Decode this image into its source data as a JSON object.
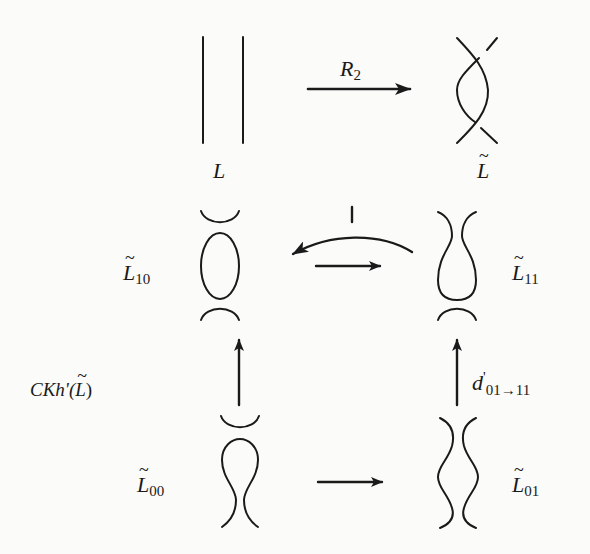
{
  "figure": {
    "move": {
      "label": "R",
      "label_subscript": "2",
      "source_label": "L",
      "target_label": "L",
      "target_tilde": "~"
    },
    "resolutions": [
      {
        "id": "10",
        "label": "L",
        "tilde": "~",
        "subscript": "10",
        "shape": "cap-circle-cup"
      },
      {
        "id": "11",
        "label": "L",
        "tilde": "~",
        "subscript": "11",
        "shape": "cap-bulb-cup"
      },
      {
        "id": "00",
        "label": "L",
        "tilde": "~",
        "subscript": "00",
        "shape": "cap-bulb-inverted"
      },
      {
        "id": "01",
        "label": "L",
        "tilde": "~",
        "subscript": "01",
        "shape": "two-wavy-strands"
      }
    ],
    "complex_label": {
      "prefix": "CKh'(",
      "letter": "L",
      "tilde": "~",
      "suffix": ")"
    },
    "differential_label": {
      "letter": "d",
      "prime": "'",
      "from": "01",
      "arrow": "→",
      "to": "11"
    },
    "arrows": [
      {
        "name": "R2-move",
        "from": "L",
        "to": "L~",
        "direction": "right"
      },
      {
        "name": "curved-back",
        "from": "11",
        "to": "10",
        "direction": "left",
        "marker": "I"
      },
      {
        "name": "horizontal-top",
        "from": "10",
        "to": "11",
        "direction": "right"
      },
      {
        "name": "vertical-left",
        "from": "00",
        "to": "10",
        "direction": "up"
      },
      {
        "name": "vertical-right",
        "from": "01",
        "to": "11",
        "direction": "up"
      },
      {
        "name": "horizontal-bottom",
        "from": "00",
        "to": "01",
        "direction": "right"
      }
    ],
    "marker_symbol": "I"
  },
  "colors": {
    "ink": "#1a1a1a",
    "paper": "#fbfbf9"
  }
}
